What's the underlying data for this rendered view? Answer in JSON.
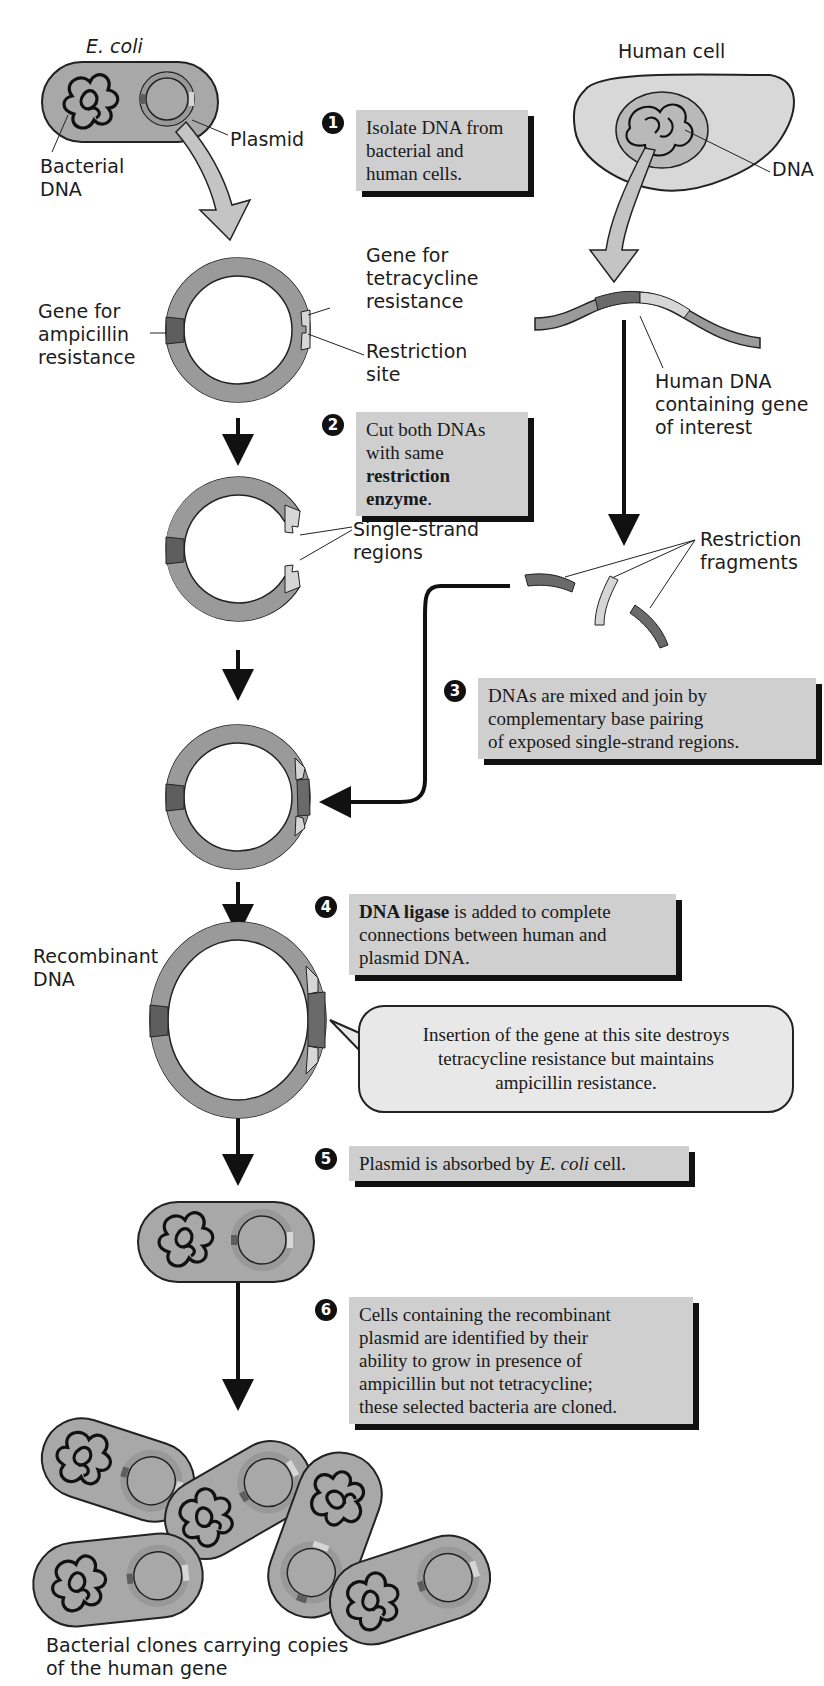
{
  "figure": {
    "colors": {
      "cell_fill": "#a8a8a8",
      "plasmid_ring": "#9a9a9a",
      "ampicillin_gene": "#5e5e5e",
      "tetracycline_gene": "#d6d6d6",
      "human_gene": "#6a6a6a",
      "step_box": "#cfcfcf",
      "arrow_block": "#c4c4c4",
      "ink": "#111111"
    }
  },
  "labels": {
    "ecoli": "E. coli",
    "human_cell": "Human cell",
    "plasmid": "Plasmid",
    "bacterial_dna": "Bacterial\nDNA",
    "dna": "DNA",
    "gene_tet": "Gene for\ntetracycline\nresistance",
    "gene_amp": "Gene for\nampicillin\nresistance",
    "restriction_site": "Restriction\nsite",
    "human_dna": "Human DNA\ncontaining gene\nof interest",
    "single_strand": "Single-strand\nregions",
    "restriction_fragments": "Restriction\nfragments",
    "recombinant_dna": "Recombinant\nDNA",
    "clones": "Bacterial clones carrying copies\nof the human gene"
  },
  "steps": [
    {
      "number": "1",
      "text": "Isolate DNA from\nbacterial and\nhuman cells."
    },
    {
      "number": "2",
      "text_plain": "Cut both DNAs\nwith same\n",
      "text_bold": "restriction enzyme",
      "text_tail": "."
    },
    {
      "number": "3",
      "text": "DNAs are mixed and join by\ncomplementary base pairing\nof exposed single-strand regions."
    },
    {
      "number": "4",
      "text_bold": "DNA ligase",
      "text_plain": " is added to complete\nconnections between human and\nplasmid DNA."
    },
    {
      "number": "5",
      "text_plain": "Plasmid is absorbed by ",
      "text_italic": "E. coli",
      "text_tail": " cell."
    },
    {
      "number": "6",
      "text": "Cells containing the recombinant\nplasmid are identified by their\nability to grow in presence of\nampicillin but not tetracycline;\nthese selected bacteria are cloned."
    }
  ],
  "callout": {
    "text": "Insertion of the gene at this site destroys\ntetracycline resistance but maintains\nampicillin resistance."
  }
}
